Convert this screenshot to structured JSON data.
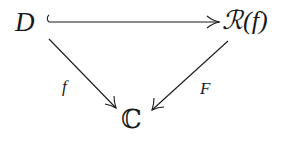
{
  "diagram": {
    "type": "commutative-diagram",
    "nodes": {
      "top_left": "D",
      "top_right": "ℛ(f)",
      "bottom": "ℂ"
    },
    "arrows": [
      {
        "from": "D",
        "to": "ℛ(f)",
        "style": "hook-inclusion",
        "label": ""
      },
      {
        "from": "D",
        "to": "ℂ",
        "style": "solid",
        "label": "f"
      },
      {
        "from": "ℛ(f)",
        "to": "ℂ",
        "style": "solid",
        "label": "F"
      }
    ],
    "labels": {
      "left_diagonal": "f",
      "right_diagonal": "F"
    },
    "colors": {
      "ink": "#1a1a1a",
      "background": "#ffffff"
    }
  }
}
